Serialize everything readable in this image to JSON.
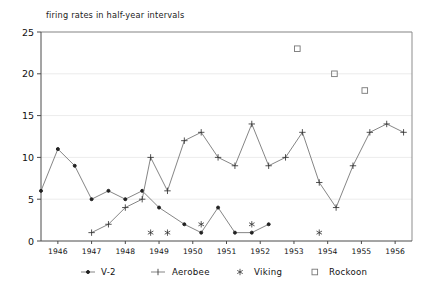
{
  "chart_data": {
    "type": "line",
    "title": "firing rates in half-year intervals",
    "xlabel": "",
    "ylabel": "",
    "xlim": [
      1945.5,
      1956.5
    ],
    "ylim": [
      0,
      25
    ],
    "ytick_values": [
      0,
      5,
      10,
      15,
      20,
      25
    ],
    "ytick_labels": [
      "0",
      "5",
      "10",
      "15",
      "20",
      "25"
    ],
    "xtick_values": [
      1946,
      1947,
      1948,
      1949,
      1950,
      1951,
      1952,
      1953,
      1954,
      1955,
      1956
    ],
    "xtick_labels": [
      "1946",
      "1947",
      "1948",
      "1949",
      "1950",
      "1951",
      "1952",
      "1953",
      "1954",
      "1955",
      "1956"
    ],
    "grid": true,
    "legend_position": "below",
    "series": [
      {
        "name": "V-2",
        "marker": "dot",
        "connected": true,
        "points": [
          [
            1945.5,
            6
          ],
          [
            1946.0,
            11
          ],
          [
            1946.5,
            9
          ],
          [
            1947.0,
            5
          ],
          [
            1947.5,
            6
          ],
          [
            1948.0,
            5
          ],
          [
            1948.5,
            6
          ],
          [
            1949.0,
            4
          ],
          [
            1949.75,
            2
          ],
          [
            1950.25,
            1
          ],
          [
            1950.75,
            4
          ],
          [
            1951.25,
            1
          ],
          [
            1951.75,
            1
          ],
          [
            1952.25,
            2
          ]
        ]
      },
      {
        "name": "Aerobee",
        "marker": "plus",
        "connected": true,
        "points": [
          [
            1947.0,
            1
          ],
          [
            1947.5,
            2
          ],
          [
            1948.0,
            4
          ],
          [
            1948.5,
            5
          ],
          [
            1948.75,
            10
          ],
          [
            1949.25,
            6
          ],
          [
            1949.75,
            12
          ],
          [
            1950.25,
            13
          ],
          [
            1950.75,
            10
          ],
          [
            1951.25,
            9
          ],
          [
            1951.75,
            14
          ],
          [
            1952.25,
            9
          ],
          [
            1952.75,
            10
          ],
          [
            1953.25,
            13
          ],
          [
            1953.75,
            7
          ],
          [
            1954.25,
            4
          ],
          [
            1954.75,
            9
          ],
          [
            1955.25,
            13
          ],
          [
            1955.75,
            14
          ],
          [
            1956.25,
            13
          ]
        ]
      },
      {
        "name": "Viking",
        "marker": "star",
        "connected": false,
        "points": [
          [
            1948.75,
            1
          ],
          [
            1949.25,
            1
          ],
          [
            1950.25,
            2
          ],
          [
            1951.75,
            2
          ],
          [
            1953.75,
            1
          ]
        ]
      },
      {
        "name": "Rockoon",
        "marker": "square",
        "connected": false,
        "points": [
          [
            1953.1,
            23
          ],
          [
            1954.2,
            20
          ],
          [
            1955.1,
            18
          ]
        ]
      }
    ]
  },
  "legend": {
    "items": [
      {
        "label": "V-2",
        "marker": "dot"
      },
      {
        "label": "Aerobee",
        "marker": "plus"
      },
      {
        "label": "Viking",
        "marker": "star"
      },
      {
        "label": "Rockoon",
        "marker": "square"
      }
    ]
  }
}
